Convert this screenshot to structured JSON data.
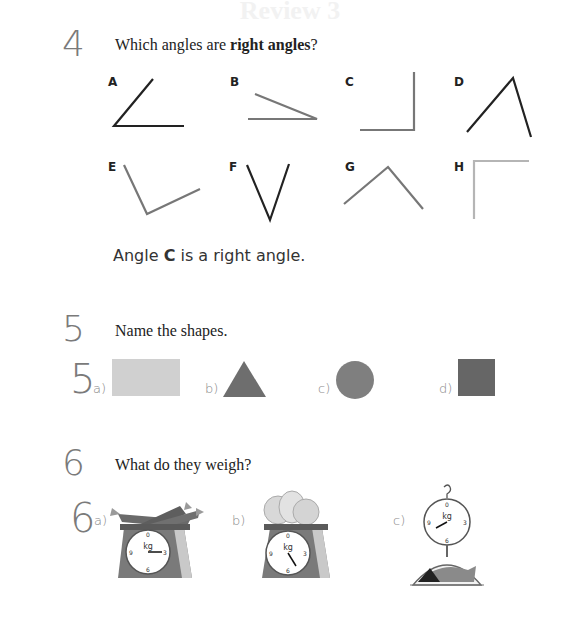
{
  "page": {
    "faded_header": "Review 3"
  },
  "question4": {
    "number": "4",
    "prompt_prefix": "Which angles are ",
    "prompt_bold": "right angles",
    "prompt_suffix": "?",
    "angles": [
      {
        "label": "A",
        "color": "#222222"
      },
      {
        "label": "B",
        "color": "#777777"
      },
      {
        "label": "C",
        "color": "#777777"
      },
      {
        "label": "D",
        "color": "#222222"
      },
      {
        "label": "E",
        "color": "#777777"
      },
      {
        "label": "F",
        "color": "#222222"
      },
      {
        "label": "G",
        "color": "#777777"
      },
      {
        "label": "H",
        "color": "#b5b5b5"
      }
    ],
    "answer_prefix": "Angle ",
    "answer_bold": "C",
    "answer_suffix": " is a right angle."
  },
  "question5": {
    "number": "5",
    "prompt": "Name the shapes.",
    "answer_number": "5",
    "shapes": [
      {
        "label": "a)",
        "shape": "rectangle",
        "color": "#d0d0d0"
      },
      {
        "label": "b)",
        "shape": "triangle",
        "color": "#6e6e6e"
      },
      {
        "label": "c)",
        "shape": "circle",
        "color": "#7f7f7f"
      },
      {
        "label": "d)",
        "shape": "square",
        "color": "#666666"
      }
    ]
  },
  "question6": {
    "number": "6",
    "prompt": "What do they weigh?",
    "answer_number": "6",
    "scales": [
      {
        "label": "a)",
        "item": "carrots",
        "scale_type": "kitchen scale",
        "unit": "kg",
        "dial": [
          "11",
          "0",
          "1",
          "2",
          "3",
          "4",
          "5",
          "6",
          "7",
          "8",
          "9",
          "10"
        ],
        "pointer": "3"
      },
      {
        "label": "b)",
        "item": "cabbages",
        "scale_type": "kitchen scale",
        "unit": "kg",
        "dial": [
          "11",
          "0",
          "1",
          "2",
          "3",
          "4",
          "5",
          "6",
          "7",
          "8",
          "9",
          "10"
        ],
        "pointer": "5"
      },
      {
        "label": "c)",
        "item": "fish",
        "scale_type": "hanging scale",
        "unit": "kg",
        "dial": [
          "11",
          "0",
          "1",
          "2",
          "3",
          "4",
          "5",
          "6",
          "7",
          "8",
          "9",
          "10"
        ],
        "pointer": "2"
      }
    ]
  }
}
